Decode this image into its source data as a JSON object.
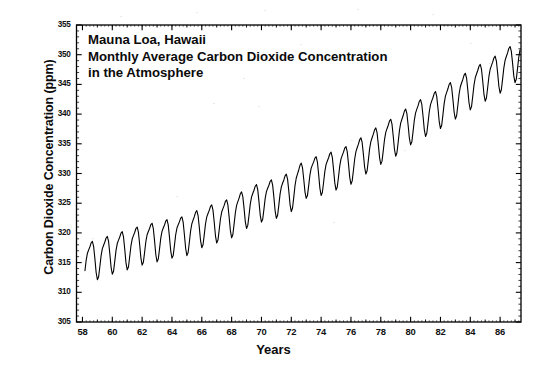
{
  "figure": {
    "background_color": "#ffffff",
    "ink_color": "#000000",
    "annotation_lines": [
      "Mauna Loa, Hawaii",
      "Monthly Average Carbon Dioxide Concentration",
      "in the Atmosphere"
    ]
  },
  "chart_data": {
    "type": "line",
    "title": "Mauna Loa, Hawaii Monthly Average Carbon Dioxide Concentration in the Atmosphere",
    "subtitle": "",
    "xlabel": "Years",
    "ylabel": "Carbon Dioxide Concentration (ppm)",
    "xlim": [
      1957.6,
      1987.4
    ],
    "ylim": [
      305,
      355
    ],
    "ytick_labels": [
      "355",
      "350",
      "345",
      "340",
      "335",
      "330",
      "325",
      "320",
      "315",
      "310",
      "305"
    ],
    "ytick_values": [
      355,
      350,
      345,
      340,
      335,
      330,
      325,
      320,
      315,
      310,
      305
    ],
    "ytick_step": 5,
    "yminor_step": 1,
    "xtick_labels": [
      "58",
      "60",
      "62",
      "64",
      "66",
      "68",
      "70",
      "72",
      "74",
      "76",
      "78",
      "80",
      "82",
      "84",
      "86"
    ],
    "xtick_values": [
      1958,
      1960,
      1962,
      1964,
      1966,
      1968,
      1970,
      1972,
      1974,
      1976,
      1978,
      1980,
      1982,
      1984,
      1986
    ],
    "xtick_step": 2,
    "xminor_step": 1,
    "grid": false,
    "legend": null,
    "ticks_direction": "in",
    "ticks_all_sides": true,
    "series": [
      {
        "name": "Monthly average CO2 concentration",
        "color": "#000000",
        "line_width": 1.1,
        "seasonal_amplitude_ppm": 3.1,
        "annual_mean": [
          {
            "year": 1958,
            "value": 315.3
          },
          {
            "year": 1959,
            "value": 315.98
          },
          {
            "year": 1960,
            "value": 316.91
          },
          {
            "year": 1961,
            "value": 317.64
          },
          {
            "year": 1962,
            "value": 318.45
          },
          {
            "year": 1963,
            "value": 318.99
          },
          {
            "year": 1964,
            "value": 319.62
          },
          {
            "year": 1965,
            "value": 320.04
          },
          {
            "year": 1966,
            "value": 321.38
          },
          {
            "year": 1967,
            "value": 322.16
          },
          {
            "year": 1968,
            "value": 323.04
          },
          {
            "year": 1969,
            "value": 324.62
          },
          {
            "year": 1970,
            "value": 325.68
          },
          {
            "year": 1971,
            "value": 326.32
          },
          {
            "year": 1972,
            "value": 327.45
          },
          {
            "year": 1973,
            "value": 329.68
          },
          {
            "year": 1974,
            "value": 330.17
          },
          {
            "year": 1975,
            "value": 331.08
          },
          {
            "year": 1976,
            "value": 332.05
          },
          {
            "year": 1977,
            "value": 333.78
          },
          {
            "year": 1978,
            "value": 335.41
          },
          {
            "year": 1979,
            "value": 336.78
          },
          {
            "year": 1980,
            "value": 338.68
          },
          {
            "year": 1981,
            "value": 340.1
          },
          {
            "year": 1982,
            "value": 341.44
          },
          {
            "year": 1983,
            "value": 343.03
          },
          {
            "year": 1984,
            "value": 344.58
          },
          {
            "year": 1985,
            "value": 346.04
          },
          {
            "year": 1986,
            "value": 347.39
          },
          {
            "year": 1987,
            "value": 349.16
          }
        ],
        "data_start": {
          "year": 1958,
          "month": 3,
          "value": 315.7
        },
        "data_end": {
          "year": 1987,
          "month": 5,
          "value": 350.2
        },
        "min_value": 312.5,
        "max_value": 350.3
      }
    ]
  }
}
